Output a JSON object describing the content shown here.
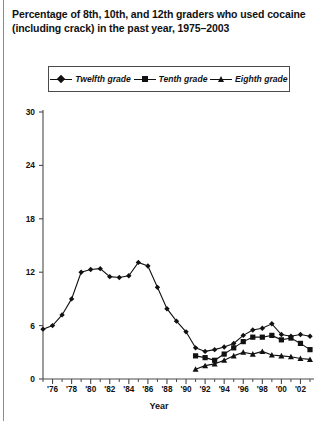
{
  "title": "Percentage of 8th, 10th, and 12th graders who used cocaine (including crack) in the past year, 1975–2003",
  "legend": {
    "position": "top-inside",
    "items": [
      {
        "label": "Twelfth grade",
        "marker": "diamond-icon"
      },
      {
        "label": "Tenth grade",
        "marker": "square-icon"
      },
      {
        "label": "Eighth grade",
        "marker": "triangle-icon"
      }
    ]
  },
  "axes": {
    "xlabel": "Year",
    "ylabel": "",
    "yticks": [
      "30",
      "24",
      "18",
      "12",
      "6",
      "0"
    ],
    "xticks": [
      "'76",
      "'78",
      "'80",
      "'82",
      "'84",
      "'86",
      "'88",
      "'90",
      "'92",
      "'94",
      "'96",
      "'98",
      "'00",
      "'02"
    ]
  },
  "colors": {
    "line": "#111111",
    "axis": "#4a4a4a",
    "background": "#ffffff",
    "border": "#8d8d8d"
  },
  "chart_data": {
    "type": "line",
    "title": "Percentage of 8th, 10th, and 12th graders who used cocaine (including crack) in the past year, 1975–2003",
    "xlabel": "Year",
    "ylabel": "",
    "xlim": [
      1975,
      2003
    ],
    "ylim": [
      0,
      30
    ],
    "yticks": [
      0,
      6,
      12,
      18,
      24,
      30
    ],
    "xticks": [
      1976,
      1978,
      1980,
      1982,
      1984,
      1986,
      1988,
      1990,
      1992,
      1994,
      1996,
      1998,
      2000,
      2002
    ],
    "grid": false,
    "legend_position": "top",
    "series": [
      {
        "name": "Twelfth grade",
        "marker": "diamond",
        "x": [
          1975,
          1976,
          1977,
          1978,
          1979,
          1980,
          1981,
          1982,
          1983,
          1984,
          1985,
          1986,
          1987,
          1988,
          1989,
          1990,
          1991,
          1992,
          1993,
          1994,
          1995,
          1996,
          1997,
          1998,
          1999,
          2000,
          2001,
          2002,
          2003
        ],
        "values": [
          5.6,
          6.0,
          7.2,
          9.0,
          12.0,
          12.3,
          12.4,
          11.5,
          11.4,
          11.6,
          13.1,
          12.7,
          10.3,
          7.9,
          6.5,
          5.3,
          3.5,
          3.1,
          3.3,
          3.6,
          4.0,
          4.9,
          5.5,
          5.7,
          6.2,
          5.0,
          4.8,
          5.0,
          4.8
        ]
      },
      {
        "name": "Tenth grade",
        "marker": "square",
        "x": [
          1991,
          1992,
          1993,
          1994,
          1995,
          1996,
          1997,
          1998,
          1999,
          2000,
          2001,
          2002,
          2003
        ],
        "values": [
          2.6,
          2.4,
          2.1,
          2.8,
          3.5,
          4.2,
          4.7,
          4.7,
          4.9,
          4.4,
          4.6,
          4.0,
          3.3
        ]
      },
      {
        "name": "Eighth grade",
        "marker": "triangle",
        "x": [
          1991,
          1992,
          1993,
          1994,
          1995,
          1996,
          1997,
          1998,
          1999,
          2000,
          2001,
          2002,
          2003
        ],
        "values": [
          1.1,
          1.5,
          1.7,
          2.1,
          2.6,
          3.0,
          2.8,
          3.1,
          2.7,
          2.6,
          2.5,
          2.3,
          2.2
        ]
      }
    ]
  }
}
